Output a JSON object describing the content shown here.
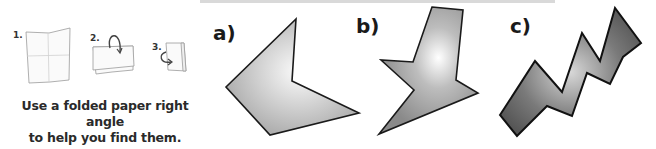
{
  "instructions": {
    "steps": [
      {
        "number": "1.",
        "icon": "unfolded-paper-icon"
      },
      {
        "number": "2.",
        "icon": "fold-paper-half-icon"
      },
      {
        "number": "3.",
        "icon": "fold-paper-quarter-icon"
      }
    ],
    "caption_line1": "Use a folded paper right angle",
    "caption_line2": "to help you find them."
  },
  "shapes": [
    {
      "label": "a)",
      "name": "shape-a",
      "fill": "light-gray-gradient",
      "points": "296,19 292,81 359,113 270,135 226,87"
    },
    {
      "label": "b)",
      "name": "shape-b",
      "fill": "light-gray-gradient",
      "points": "432,7 463,10 456,80 478,93 379,134 414,90 381,60 413,62"
    },
    {
      "label": "c)",
      "name": "shape-c",
      "fill": "dark-gray-gradient",
      "points": "500,115 535,61 562,92 582,33 600,61 615,8 641,43 623,57 610,84 587,73 572,116 547,106 517,136"
    }
  ],
  "colors": {
    "stroke": "#1a1a1a",
    "light_fill": "#c8c8c8",
    "dark_fill": "#6e6e6e"
  }
}
